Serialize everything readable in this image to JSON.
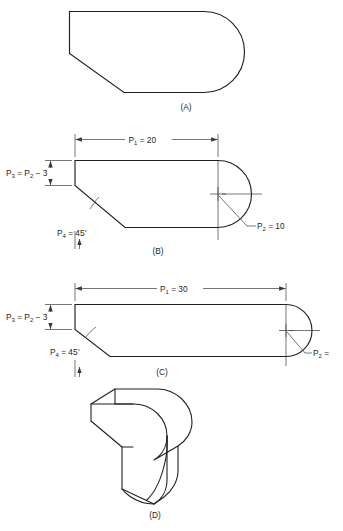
{
  "drawing": {
    "title": "Parametric extruded profile — four views",
    "background_color": "#ffffff",
    "line_color": "#231f20",
    "dimension_color": "#3a3a3c"
  },
  "views": [
    {
      "id": "A",
      "label": "(A)",
      "description": "finished profile, no dimensions"
    },
    {
      "id": "B",
      "label": "(B)",
      "description": "dimensioned profile, P1 = 20",
      "dimensions": {
        "p1": "P",
        "p1_sub": "1",
        "p1_value": "= 20",
        "p1_full": "P1 = 20",
        "p3": "P",
        "p3_sub": "3",
        "p3_eq": "= P",
        "p3_sub2": "2",
        "p3_tail": "− 3",
        "p3_full": "P3 = P2 − 3",
        "p4": "P",
        "p4_sub": "4",
        "p4_value": "= 45",
        "p4_deg": "°",
        "p4_full": "P4 = 45°",
        "p2": "P",
        "p2_sub": "2",
        "p2_value": "= 10",
        "p2_full": "P2 = 10"
      }
    },
    {
      "id": "C",
      "label": "(C)",
      "description": "dimensioned profile, P1 = 30",
      "dimensions": {
        "p1": "P",
        "p1_sub": "1",
        "p1_value": "= 30",
        "p1_full": "P1 = 30",
        "p3": "P",
        "p3_sub": "3",
        "p3_eq": "= P",
        "p3_sub2": "2",
        "p3_tail": "− 3",
        "p3_full": "P3 = P2 − 3",
        "p4": "P",
        "p4_sub": "4",
        "p4_value": "= 45",
        "p4_deg": "°",
        "p4_full": "P4 = 45°",
        "p2": "P",
        "p2_sub": "2",
        "p2_value": "=",
        "p2_full": "P2 ="
      }
    },
    {
      "id": "D",
      "label": "(D)",
      "description": "isometric pictorial of the extruded solid"
    }
  ]
}
